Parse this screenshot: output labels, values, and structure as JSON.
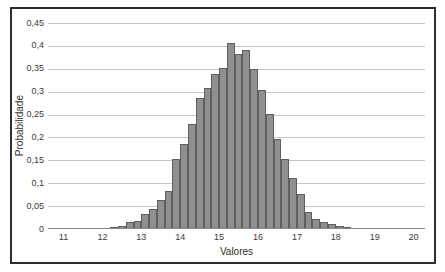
{
  "chart_data": {
    "type": "bar",
    "subtype": "histogram",
    "title": "",
    "xlabel": "Valores",
    "ylabel": "Probabilidade",
    "xlim": [
      10.6,
      20.3
    ],
    "ylim": [
      0,
      0.45
    ],
    "grid": "horizontal",
    "legend": "none",
    "x_ticks": [
      11,
      12,
      13,
      14,
      15,
      16,
      17,
      18,
      19,
      20
    ],
    "y_tick_labels": [
      "0",
      "0,05",
      "0,1",
      "0,15",
      "0,2",
      "0,25",
      "0,3",
      "0,35",
      "0,4",
      "0,45"
    ],
    "decimal_separator": ",",
    "bin_width": 0.2,
    "bin_starts": [
      12.2,
      12.4,
      12.6,
      12.8,
      13.0,
      13.2,
      13.4,
      13.6,
      13.8,
      14.0,
      14.2,
      14.4,
      14.6,
      14.8,
      15.0,
      15.2,
      15.4,
      15.6,
      15.8,
      16.0,
      16.2,
      16.4,
      16.6,
      16.8,
      17.0,
      17.2,
      17.4,
      17.6,
      17.8,
      18.0,
      18.2
    ],
    "values": [
      0.002,
      0.005,
      0.014,
      0.015,
      0.031,
      0.042,
      0.062,
      0.081,
      0.151,
      0.183,
      0.227,
      0.284,
      0.306,
      0.337,
      0.35,
      0.405,
      0.38,
      0.389,
      0.347,
      0.301,
      0.25,
      0.195,
      0.15,
      0.11,
      0.075,
      0.035,
      0.02,
      0.014,
      0.008,
      0.005,
      0.002
    ],
    "colors": {
      "bar_fill": "#8f8f8f",
      "bar_border": "#5f5f5f",
      "gridline": "#c6c6c6",
      "axis_line": "#8a8a8a",
      "frame_border": "#2e2e2e",
      "text": "#3a3a3a",
      "background": "#ffffff"
    }
  }
}
